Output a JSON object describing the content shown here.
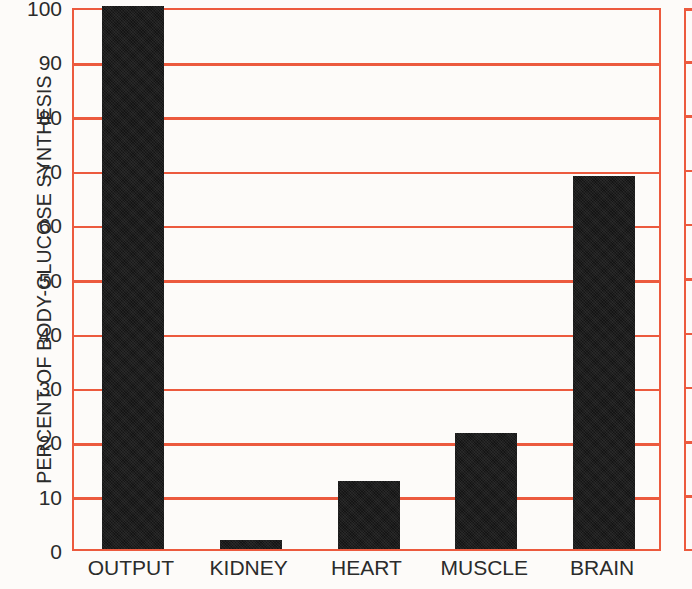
{
  "chart_data": {
    "type": "bar",
    "title": "",
    "categories": [
      "OUTPUT",
      "KIDNEY",
      "HEART",
      "MUSCLE",
      "BRAIN"
    ],
    "values": [
      100,
      1.7,
      12.5,
      21.3,
      68.7
    ],
    "xlabel": "",
    "ylabel": "PERCENT OF BODY-GLUCOSE SYNTHESIS",
    "ylim": [
      0,
      100
    ],
    "yticks": [
      0,
      10,
      20,
      30,
      40,
      50,
      60,
      70,
      80,
      90,
      100
    ],
    "ytick_labels": [
      "0",
      "10",
      "20",
      "30",
      "40",
      "50",
      "60",
      "70",
      "80",
      "90",
      "100"
    ],
    "grid": true,
    "grid_axis": "y",
    "grid_color": "#ec5a3e",
    "bar_color": "#141414",
    "axis_color": "#ec5a3e",
    "background_color": "#fdfbf9",
    "legend": null,
    "legend_position": "none",
    "annotations": []
  },
  "axis": {
    "y_title": "PERCENT OF BODY-GLUCOSE SYNTHESIS"
  },
  "adjacent_panel": {
    "note": "",
    "grid_color": "#ec5a3e"
  }
}
